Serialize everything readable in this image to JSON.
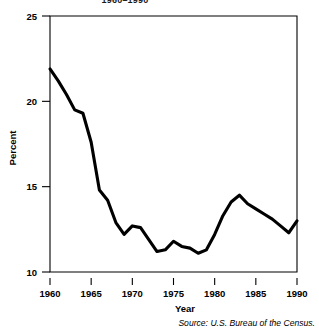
{
  "chart_data": {
    "type": "line",
    "title": "1960–1990",
    "title_clipped": true,
    "xlabel": "Year",
    "ylabel": "Percent",
    "source": "Source: U.S. Bureau of the Census.",
    "xlim": [
      1960,
      1990
    ],
    "ylim": [
      10,
      25
    ],
    "xticks": [
      1960,
      1965,
      1970,
      1975,
      1980,
      1985,
      1990
    ],
    "xticklabels": [
      "1960",
      "1965",
      "1970",
      "1975",
      "1980",
      "1985",
      "1990"
    ],
    "yticks": [
      10,
      15,
      20,
      25
    ],
    "yticklabels": [
      "10",
      "15",
      "20",
      "25"
    ],
    "grid": false,
    "legend": false,
    "line_color": "#000000",
    "x": [
      1960,
      1961,
      1962,
      1963,
      1964,
      1965,
      1966,
      1967,
      1968,
      1969,
      1970,
      1971,
      1972,
      1973,
      1974,
      1975,
      1976,
      1977,
      1978,
      1979,
      1980,
      1981,
      1982,
      1983,
      1984,
      1985,
      1986,
      1987,
      1988,
      1989,
      1990
    ],
    "values": [
      21.9,
      21.2,
      20.4,
      19.5,
      19.3,
      17.6,
      14.8,
      14.2,
      12.9,
      12.2,
      12.7,
      12.6,
      11.9,
      11.2,
      11.3,
      11.8,
      11.5,
      11.4,
      11.1,
      11.3,
      12.2,
      13.3,
      14.1,
      14.5,
      14.0,
      13.7,
      13.4,
      13.1,
      12.7,
      12.3,
      13.0
    ],
    "annotations": []
  },
  "layout": {
    "plot_left": 50,
    "plot_right": 297,
    "plot_top": 16,
    "plot_bottom": 272
  }
}
